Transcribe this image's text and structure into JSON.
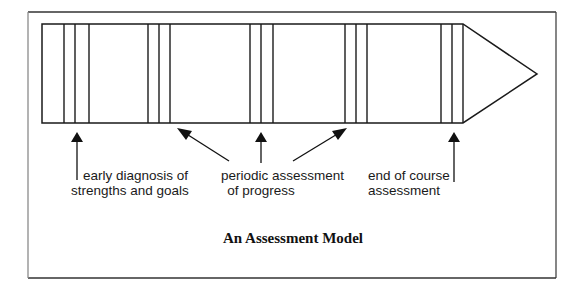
{
  "colors": {
    "stroke": "#1a1a1a",
    "frame_left": "#8a8a8a",
    "frame": "#333333",
    "background": "#ffffff"
  },
  "diagram": {
    "caption": "An Assessment Model",
    "timeline": {
      "shape": "arrow",
      "marker_groups": 5,
      "lines_per_group": 3
    },
    "labels": [
      {
        "id": "early",
        "lines": [
          "early diagnosis of",
          "strengths and goals"
        ]
      },
      {
        "id": "periodic",
        "lines": [
          "periodic assessment",
          "of progress"
        ]
      },
      {
        "id": "end",
        "lines": [
          "end of course",
          "assessment"
        ]
      }
    ]
  }
}
